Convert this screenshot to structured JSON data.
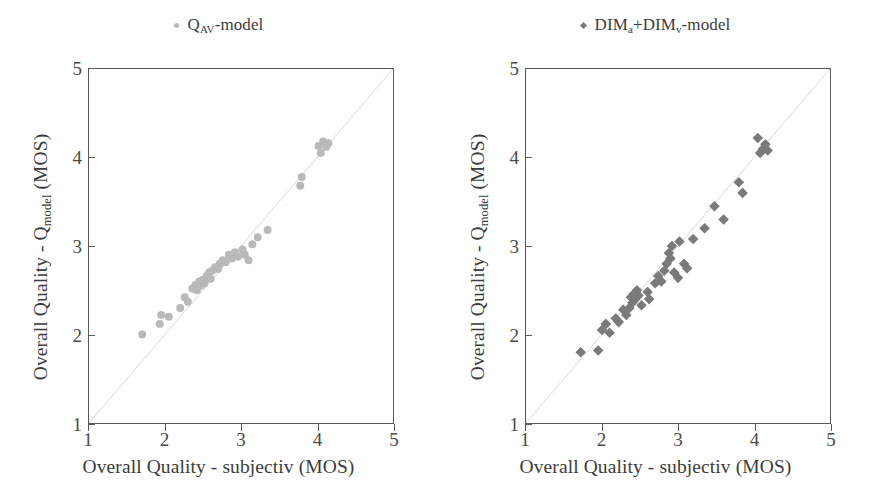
{
  "figure": {
    "width": 874,
    "height": 502,
    "background": "#ffffff",
    "panel_count": 2
  },
  "chart_data": [
    {
      "type": "scatter",
      "panel": "left",
      "title": "",
      "legend": {
        "label": "Q_AV-model",
        "marker": "circle",
        "color": "#b9b9b9",
        "position": "top-center"
      },
      "series_name": "Q_AV-model",
      "marker_color": "#b9b9b9",
      "marker_shape": "circle",
      "marker_size": 8,
      "xlabel": "Overall Quality - subjectiv (MOS)",
      "ylabel": "Overall Quality - Q_model (MOS)",
      "xlim": [
        1,
        5
      ],
      "ylim": [
        1,
        5
      ],
      "xticks": [
        1,
        2,
        3,
        4,
        5
      ],
      "yticks": [
        1,
        2,
        3,
        4,
        5
      ],
      "grid": false,
      "identity_line": {
        "from": [
          1,
          1
        ],
        "to": [
          5,
          5
        ],
        "color": "#d8d8d8"
      },
      "points": [
        [
          1.7,
          2.0
        ],
        [
          1.93,
          2.12
        ],
        [
          1.95,
          2.22
        ],
        [
          2.05,
          2.2
        ],
        [
          2.2,
          2.3
        ],
        [
          2.26,
          2.42
        ],
        [
          2.3,
          2.37
        ],
        [
          2.36,
          2.52
        ],
        [
          2.4,
          2.56
        ],
        [
          2.42,
          2.5
        ],
        [
          2.45,
          2.6
        ],
        [
          2.47,
          2.55
        ],
        [
          2.5,
          2.62
        ],
        [
          2.52,
          2.58
        ],
        [
          2.55,
          2.66
        ],
        [
          2.58,
          2.7
        ],
        [
          2.6,
          2.63
        ],
        [
          2.62,
          2.72
        ],
        [
          2.66,
          2.76
        ],
        [
          2.7,
          2.74
        ],
        [
          2.72,
          2.8
        ],
        [
          2.76,
          2.84
        ],
        [
          2.8,
          2.82
        ],
        [
          2.84,
          2.9
        ],
        [
          2.88,
          2.86
        ],
        [
          2.92,
          2.93
        ],
        [
          2.96,
          2.88
        ],
        [
          3.02,
          2.96
        ],
        [
          3.05,
          2.9
        ],
        [
          3.1,
          2.84
        ],
        [
          3.15,
          3.02
        ],
        [
          3.22,
          3.1
        ],
        [
          3.35,
          3.18
        ],
        [
          3.78,
          3.68
        ],
        [
          3.8,
          3.78
        ],
        [
          4.02,
          4.13
        ],
        [
          4.05,
          4.05
        ],
        [
          4.08,
          4.18
        ],
        [
          4.12,
          4.12
        ],
        [
          4.15,
          4.16
        ]
      ]
    },
    {
      "type": "scatter",
      "panel": "right",
      "title": "",
      "legend": {
        "label": "DIM_a+DIM_v-model",
        "marker": "diamond",
        "color": "#7a7a7a",
        "position": "top-center"
      },
      "series_name": "DIM_a+DIM_v-model",
      "marker_color": "#7a7a7a",
      "marker_shape": "diamond",
      "marker_size": 9,
      "xlabel": "Overall Quality - subjectiv (MOS)",
      "ylabel": "Overall Quality - Q_model (MOS)",
      "xlim": [
        1,
        5
      ],
      "ylim": [
        1,
        5
      ],
      "xticks": [
        1,
        2,
        3,
        4,
        5
      ],
      "yticks": [
        1,
        2,
        3,
        4,
        5
      ],
      "grid": false,
      "identity_line": {
        "from": [
          1,
          1
        ],
        "to": [
          5,
          5
        ],
        "color": "#d8d8d8"
      },
      "points": [
        [
          1.72,
          1.8
        ],
        [
          1.95,
          1.82
        ],
        [
          2.0,
          2.05
        ],
        [
          2.05,
          2.12
        ],
        [
          2.1,
          2.02
        ],
        [
          2.18,
          2.18
        ],
        [
          2.22,
          2.14
        ],
        [
          2.28,
          2.28
        ],
        [
          2.32,
          2.22
        ],
        [
          2.36,
          2.3
        ],
        [
          2.38,
          2.42
        ],
        [
          2.4,
          2.36
        ],
        [
          2.42,
          2.46
        ],
        [
          2.44,
          2.4
        ],
        [
          2.46,
          2.5
        ],
        [
          2.48,
          2.44
        ],
        [
          2.52,
          2.33
        ],
        [
          2.6,
          2.48
        ],
        [
          2.62,
          2.4
        ],
        [
          2.7,
          2.58
        ],
        [
          2.74,
          2.66
        ],
        [
          2.78,
          2.6
        ],
        [
          2.82,
          2.72
        ],
        [
          2.85,
          2.8
        ],
        [
          2.88,
          2.92
        ],
        [
          2.9,
          2.86
        ],
        [
          2.92,
          3.0
        ],
        [
          2.95,
          2.7
        ],
        [
          3.0,
          2.64
        ],
        [
          3.02,
          3.05
        ],
        [
          3.08,
          2.8
        ],
        [
          3.12,
          2.75
        ],
        [
          3.2,
          3.08
        ],
        [
          3.35,
          3.2
        ],
        [
          3.48,
          3.45
        ],
        [
          3.6,
          3.3
        ],
        [
          3.8,
          3.72
        ],
        [
          3.85,
          3.6
        ],
        [
          4.05,
          4.22
        ],
        [
          4.08,
          4.05
        ],
        [
          4.12,
          4.1
        ],
        [
          4.15,
          4.15
        ],
        [
          4.18,
          4.08
        ]
      ]
    }
  ],
  "panels": [
    {
      "id": "left",
      "legend_label_parts": {
        "pre": "Q",
        "sub": "AV",
        "post": "-model"
      },
      "legend_marker_name": "legend-marker-circle",
      "axis": {
        "xlabel": "Overall Quality - subjectiv (MOS)",
        "ylabel_pre": "Overall Quality - Q",
        "ylabel_sub": "model",
        "ylabel_post": " (MOS)",
        "xticks": [
          "1",
          "2",
          "3",
          "4",
          "5"
        ],
        "yticks": [
          "1",
          "2",
          "3",
          "4",
          "5"
        ]
      }
    },
    {
      "id": "right",
      "legend_label_parts": {
        "pre": "DIM",
        "sub": "a",
        "mid": "+DIM",
        "sub2": "v",
        "post": "-model"
      },
      "legend_marker_name": "legend-marker-diamond",
      "axis": {
        "xlabel": "Overall Quality - subjectiv (MOS)",
        "ylabel_pre": "Overall Quality - Q",
        "ylabel_sub": "model",
        "ylabel_post": " (MOS)",
        "xticks": [
          "1",
          "2",
          "3",
          "4",
          "5"
        ],
        "yticks": [
          "1",
          "2",
          "3",
          "4",
          "5"
        ]
      }
    }
  ],
  "colors": {
    "axis": "#5a5a5a",
    "text": "#3c3c3c",
    "identity_line": "#d8d8d8",
    "marker_left": "#b9b9b9",
    "marker_right": "#7a7a7a",
    "background": "#ffffff"
  }
}
